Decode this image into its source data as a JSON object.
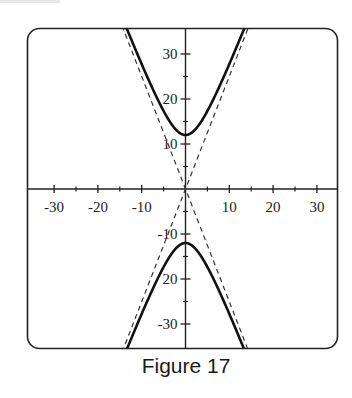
{
  "figure": {
    "caption": "Figure 17"
  },
  "chart_data": {
    "type": "line",
    "title": "",
    "caption": "Figure 17",
    "xlabel": "",
    "ylabel": "",
    "xlim": [
      -30,
      35
    ],
    "ylim": [
      -35,
      36
    ],
    "grid": false,
    "legend": "none",
    "x_ticks": [
      -30,
      -20,
      -10,
      10,
      20,
      30
    ],
    "x_tick_labels": [
      "-30",
      "-20",
      "-10",
      "10",
      "20",
      "30"
    ],
    "x_minor_ticks": [
      -25,
      -15,
      -5,
      5,
      15,
      25
    ],
    "y_ticks": [
      30,
      20,
      10,
      -10,
      -20,
      -30
    ],
    "y_tick_labels": [
      "30",
      "20",
      "10",
      "-10",
      "20",
      "-30"
    ],
    "y_minor_ticks": [
      25,
      15,
      5,
      -5,
      -15,
      -25
    ],
    "series": [
      {
        "name": "hyperbola upper branch",
        "style": "solid",
        "equation": "y^2/144 - x^2/23 = 1, y > 0",
        "x": [
          -13.8,
          -10,
          -6,
          -3,
          0,
          3,
          6,
          10,
          13.8
        ],
        "y": [
          36.3,
          28.0,
          19.2,
          14.2,
          12.0,
          14.2,
          19.2,
          28.0,
          36.3
        ]
      },
      {
        "name": "hyperbola lower branch",
        "style": "solid",
        "equation": "y^2/144 - x^2/23 = 1, y < 0",
        "x": [
          -13.5,
          -10,
          -6,
          -3,
          0,
          3,
          6,
          10,
          13.5
        ],
        "y": [
          -35.4,
          -28.0,
          -19.2,
          -14.2,
          -12.0,
          -14.2,
          -19.2,
          -28.0,
          -35.4
        ]
      },
      {
        "name": "asymptote y = 2.5x",
        "style": "dashed",
        "x": [
          -14.5,
          14.5
        ],
        "y": [
          -36.3,
          36.3
        ]
      },
      {
        "name": "asymptote y = -2.5x",
        "style": "dashed",
        "x": [
          -14.5,
          14.5
        ],
        "y": [
          36.3,
          -36.3
        ]
      }
    ],
    "annotations": []
  }
}
